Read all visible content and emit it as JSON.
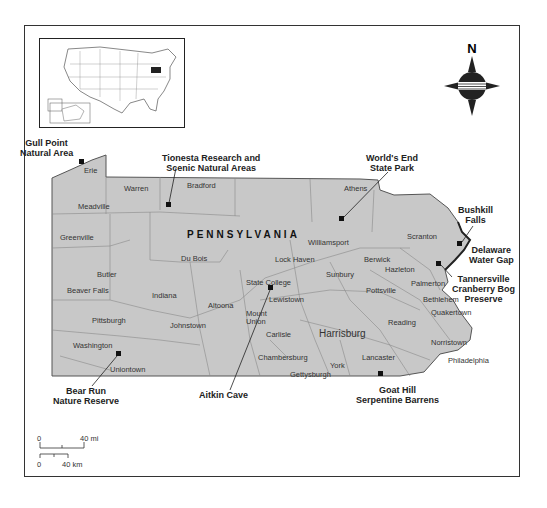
{
  "map": {
    "state_label": "PENNSYLVANIA",
    "colors": {
      "land": "#c8c8c8",
      "border": "#555555",
      "frame": "#333333"
    },
    "compass": {
      "north_label": "N"
    },
    "scale": {
      "mi_zero": "0",
      "mi_label": "40 mi",
      "km_zero": "0",
      "km_label": "40 km"
    },
    "cities": [
      {
        "name": "Erie",
        "x": 84,
        "y": 166
      },
      {
        "name": "Warren",
        "x": 124,
        "y": 184
      },
      {
        "name": "Bradford",
        "x": 187,
        "y": 181
      },
      {
        "name": "Athens",
        "x": 344,
        "y": 184
      },
      {
        "name": "Meadville",
        "x": 78,
        "y": 202
      },
      {
        "name": "Greenville",
        "x": 60,
        "y": 233
      },
      {
        "name": "Williamsport",
        "x": 308,
        "y": 238
      },
      {
        "name": "Scranton",
        "x": 407,
        "y": 232
      },
      {
        "name": "Du Bois",
        "x": 181,
        "y": 254
      },
      {
        "name": "Lock Haven",
        "x": 275,
        "y": 255
      },
      {
        "name": "Berwick",
        "x": 364,
        "y": 255
      },
      {
        "name": "Hazleton",
        "x": 385,
        "y": 265
      },
      {
        "name": "Butler",
        "x": 97,
        "y": 270
      },
      {
        "name": "Sunbury",
        "x": 326,
        "y": 270
      },
      {
        "name": "State College",
        "x": 246,
        "y": 278
      },
      {
        "name": "Palmerton",
        "x": 411,
        "y": 279
      },
      {
        "name": "Beaver Falls",
        "x": 67,
        "y": 286
      },
      {
        "name": "Pottsville",
        "x": 366,
        "y": 286
      },
      {
        "name": "Indiana",
        "x": 152,
        "y": 291
      },
      {
        "name": "Lewistown",
        "x": 269,
        "y": 295
      },
      {
        "name": "Bethlehem",
        "x": 423,
        "y": 295
      },
      {
        "name": "Altoona",
        "x": 208,
        "y": 301
      },
      {
        "name": "Quakertown",
        "x": 431,
        "y": 308
      },
      {
        "name": "Pittsburgh",
        "x": 92,
        "y": 316
      },
      {
        "name": "Mount",
        "x": 246,
        "y": 309
      },
      {
        "name": "Union",
        "x": 246,
        "y": 317
      },
      {
        "name": "Johnstown",
        "x": 170,
        "y": 321
      },
      {
        "name": "Reading",
        "x": 388,
        "y": 318
      },
      {
        "name": "Carlisle",
        "x": 266,
        "y": 330
      },
      {
        "name": "Harrisburg",
        "x": 319,
        "y": 328
      },
      {
        "name": "Washington",
        "x": 73,
        "y": 341
      },
      {
        "name": "Norristown",
        "x": 431,
        "y": 338
      },
      {
        "name": "Chambersburg",
        "x": 258,
        "y": 353
      },
      {
        "name": "Lancaster",
        "x": 362,
        "y": 353
      },
      {
        "name": "Philadelphia",
        "x": 448,
        "y": 356
      },
      {
        "name": "York",
        "x": 330,
        "y": 361
      },
      {
        "name": "Uniontown",
        "x": 110,
        "y": 365
      },
      {
        "name": "Gettysburgh",
        "x": 290,
        "y": 370
      }
    ],
    "sites": [
      {
        "name": "Gull Point\nNatural Area",
        "lines": [
          "Gull Point",
          "Natural Area"
        ],
        "x": 20,
        "y": 138,
        "marker": [
          82,
          162
        ]
      },
      {
        "name": "Tionesta Research and Scenic Natural Areas",
        "lines": [
          "Tionesta Research and",
          "Scenic Natural Areas"
        ],
        "x": 162,
        "y": 153,
        "marker": [
          169,
          205
        ]
      },
      {
        "name": "World's End State Park",
        "lines": [
          "World's End",
          "State Park"
        ],
        "x": 366,
        "y": 153,
        "marker": [
          342,
          219
        ]
      },
      {
        "name": "Bushkill Falls",
        "lines": [
          "Bushkill",
          "Falls"
        ],
        "x": 458,
        "y": 205,
        "marker": [
          460,
          244
        ]
      },
      {
        "name": "Delaware Water Gap",
        "lines": [
          "Delaware",
          "Water Gap"
        ],
        "x": 469,
        "y": 245,
        "marker": null
      },
      {
        "name": "Tannersville Cranberry Bog Preserve",
        "lines": [
          "Tannersville",
          "Cranberry Bog",
          "Preserve"
        ],
        "x": 452,
        "y": 274,
        "marker": [
          439,
          264
        ]
      },
      {
        "name": "Bear Run Nature Reserve",
        "lines": [
          "Bear Run",
          "Nature Reserve"
        ],
        "x": 53,
        "y": 386,
        "marker": [
          119,
          354
        ]
      },
      {
        "name": "Aitkin Cave",
        "lines": [
          "Aitkin Cave"
        ],
        "x": 199,
        "y": 390,
        "marker": [
          271,
          288
        ]
      },
      {
        "name": "Goat Hill Serpentine Barrens",
        "lines": [
          "Goat Hill",
          "Serpentine Barrens"
        ],
        "x": 356,
        "y": 385,
        "marker": [
          381,
          374
        ]
      }
    ]
  }
}
